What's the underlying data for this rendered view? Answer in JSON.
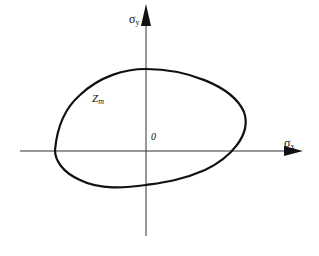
{
  "diagram": {
    "axes": {
      "x": {
        "symbol": "σ",
        "subscript": "x"
      },
      "y": {
        "symbol": "σ",
        "subscript": "y"
      }
    },
    "origin_label": "0",
    "curve_label": {
      "main": "Z",
      "subscript": "m"
    },
    "colors": {
      "line": "#111111",
      "axis": "#333333",
      "background": "#ffffff"
    }
  }
}
